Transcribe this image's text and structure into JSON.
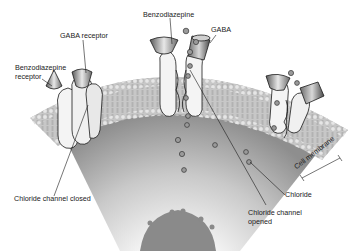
{
  "labels": {
    "gaba_receptor": "GABA receptor",
    "benzodiazepine_receptor_line1": "Benzodiazepine",
    "benzodiazepine_receptor_line2": "receptor",
    "benzodiazepine": "Benzodiazepine",
    "gaba": "GABA",
    "chloride_channel_closed": "Chloride channel closed",
    "chloride_channel_opened_line1": "Chloride channel",
    "chloride_channel_opened_line2": "opened",
    "chloride": "Chloride",
    "cell_membrane": "Cell membrane"
  },
  "colors": {
    "background": "#ffffff",
    "membrane_head": "#d9d9d9",
    "membrane_tail": "#bdbdbd",
    "cytoplasm_dark": "#8f8f8f",
    "cytoplasm_light": "#f2f2f2",
    "protein": "#f4f4f4",
    "outline": "#1a1a1a",
    "ion": "#9a9a9a"
  }
}
